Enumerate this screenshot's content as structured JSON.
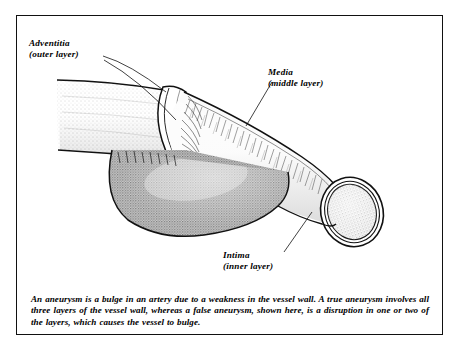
{
  "figure": {
    "frame_color": "#111111",
    "background_color": "#ffffff"
  },
  "labels": {
    "adventitia": {
      "name": "Adventitia",
      "qualifier": "(outer layer)"
    },
    "media": {
      "name": "Media",
      "qualifier": "(middle layer)"
    },
    "intima": {
      "name": "Intima",
      "qualifier": "(inner layer)"
    }
  },
  "caption": {
    "text": "An aneurysm is a bulge in an artery due to a weakness in the vessel wall. A true aneurysm involves all three layers of the vessel wall, whereas a false aneurysm, shown here, is a disruption in one or two of the layers, which causes the vessel to bulge."
  },
  "illustration": {
    "parts": [
      "artery-tube",
      "adventitia-cut-collar",
      "media-fiber-layer",
      "aneurysm-bulge",
      "cut-end-lumen"
    ],
    "tones": {
      "tube_light": "#f2f2f2",
      "stipple_gray": "#9a9a9a",
      "bulge_gray": "#8d8d8d",
      "outline": "#111111"
    }
  }
}
